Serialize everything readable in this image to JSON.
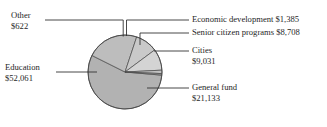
{
  "chart_data": {
    "type": "pie",
    "title": "",
    "subtitle": "",
    "xlabel": "",
    "ylabel": "",
    "legend_position": "none",
    "grid": false,
    "total": 92940,
    "value_prefix": "$",
    "categories": [
      "Education",
      "General fund",
      "Cities",
      "Senior citizen programs",
      "Economic development",
      "Other"
    ],
    "values": [
      52061,
      21133,
      9031,
      8708,
      1385,
      622
    ],
    "slices": [
      {
        "name": "education",
        "label": "Education",
        "value_label": "$52,061",
        "value": 52061,
        "percent": 56.0,
        "angle": 201.7,
        "color": "#b2b2b2"
      },
      {
        "name": "general-fund",
        "label": "General fund",
        "value_label": "$21,133",
        "value": 21133,
        "percent": 22.7,
        "angle": 81.9,
        "color": "#bdbdbd"
      },
      {
        "name": "cities",
        "label": "Cities",
        "value_label": "$9,031",
        "value": 9031,
        "percent": 9.7,
        "angle": 35.0,
        "color": "#c9c9c9"
      },
      {
        "name": "senior-citizen-programs",
        "label": "Senior citizen programs",
        "value_label": "$8,708",
        "value": 8708,
        "percent": 9.4,
        "angle": 33.7,
        "color": "#d4d4d4"
      },
      {
        "name": "economic-development",
        "label": "Economic development",
        "value_label": "$1,385",
        "value": 1385,
        "percent": 1.5,
        "angle": 5.4,
        "color": "#c2c2c2"
      },
      {
        "name": "other",
        "label": "Other",
        "value_label": "$622",
        "value": 622,
        "percent": 0.7,
        "angle": 2.4,
        "color": "#9a9a9a"
      }
    ]
  },
  "callouts": {
    "other": {
      "line1": "Other",
      "line2": "$622"
    },
    "education": {
      "line1": "Education",
      "line2": "$52,061"
    },
    "economic_development": {
      "line1": "Economic development $1,385",
      "line2": ""
    },
    "senior_citizen_programs": {
      "line1": "Senior citizen programs $8,708",
      "line2": ""
    },
    "cities": {
      "line1": "Cities",
      "line2": "$9,031"
    },
    "general_fund": {
      "line1": "General fund",
      "line2": "$21,133"
    }
  }
}
